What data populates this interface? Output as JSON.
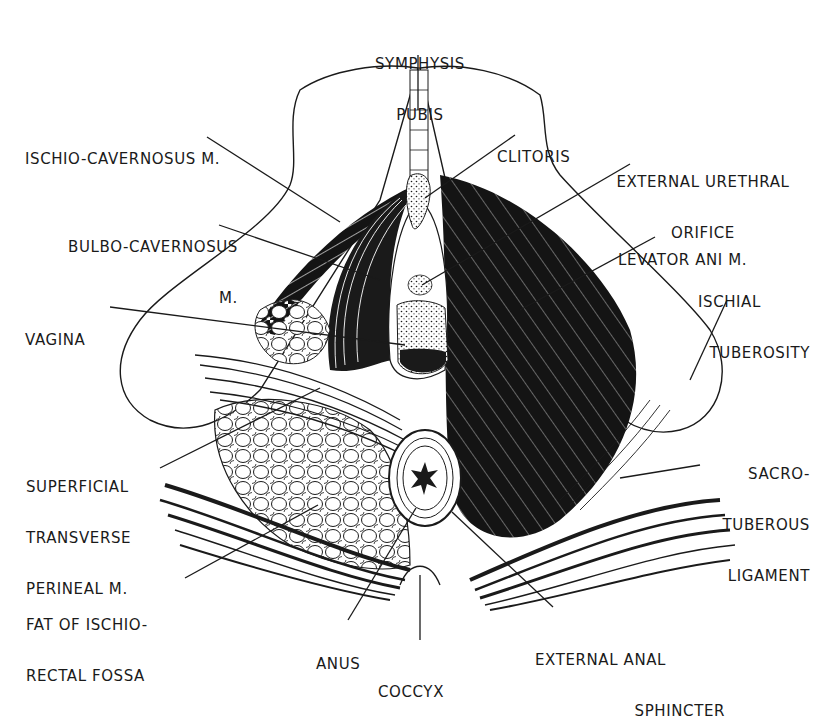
{
  "diagram": {
    "type": "anatomical-illustration",
    "colors": {
      "ink": "#1a1a1a",
      "background": "#ffffff"
    },
    "labels": {
      "symphysis_pubis": {
        "line1": "SYMPHYSIS",
        "line2": "PUBIS"
      },
      "ischio_cavernosus": {
        "line1": "ISCHIO-CAVERNOSUS M."
      },
      "clitoris": {
        "line1": "CLITORIS"
      },
      "external_urethral_orifice": {
        "line1": "EXTERNAL URETHRAL",
        "line2": "ORIFICE"
      },
      "bulbo_cavernosus": {
        "line1": "BULBO-CAVERNOSUS",
        "line2": "M."
      },
      "levator_ani": {
        "line1": "LEVATOR ANI M."
      },
      "ischial_tuberosity": {
        "line1": "ISCHIAL",
        "line2": "TUBEROSITY"
      },
      "vagina": {
        "line1": "VAGINA"
      },
      "superficial_transverse_perineal": {
        "line1": "SUPERFICIAL",
        "line2": "TRANSVERSE",
        "line3": "PERINEAL M."
      },
      "sacrotuberous_ligament": {
        "line1": "SACRO-",
        "line2": "TUBEROUS",
        "line3": "LIGAMENT"
      },
      "fat_ischiorectal_fossa": {
        "line1": "FAT OF ISCHIO-",
        "line2": "RECTAL FOSSA"
      },
      "anus": {
        "line1": "ANUS"
      },
      "coccyx": {
        "line1": "COCCYX"
      },
      "external_anal_sphincter": {
        "line1": "EXTERNAL ANAL",
        "line2": "SPHINCTER"
      }
    }
  }
}
